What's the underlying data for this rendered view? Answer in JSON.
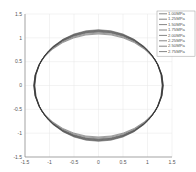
{
  "chart_data": {
    "type": "line",
    "title": "",
    "xlabel": "",
    "ylabel": "",
    "xlim": [
      -1.5,
      1.5
    ],
    "ylim": [
      -1.5,
      1.5
    ],
    "xticks": [
      "-1.5",
      "-1",
      "-0.5",
      "0",
      "0.5",
      "1",
      "1.5"
    ],
    "yticks": [
      "1.5",
      "1",
      "0.5",
      "0",
      "-0.5",
      "-1",
      "-1.5"
    ],
    "grid": true,
    "legend_position": "upper right",
    "series": [
      {
        "name": "1.00MPa",
        "a": 1.3,
        "b": 1.17
      },
      {
        "name": "1.25MPa",
        "a": 1.3,
        "b": 1.16
      },
      {
        "name": "1.50MPa",
        "a": 1.31,
        "b": 1.15
      },
      {
        "name": "1.75MPa",
        "a": 1.31,
        "b": 1.14
      },
      {
        "name": "2.00MPa",
        "a": 1.31,
        "b": 1.13
      },
      {
        "name": "2.25MPa",
        "a": 1.32,
        "b": 1.12
      },
      {
        "name": "2.50MPa",
        "a": 1.32,
        "b": 1.1
      },
      {
        "name": "2.75MPa",
        "a": 1.32,
        "b": 1.08
      }
    ],
    "line_color": "#333333"
  }
}
